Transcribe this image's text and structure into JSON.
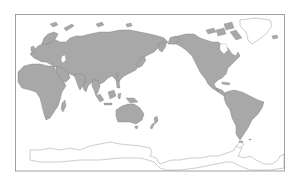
{
  "map": {
    "projection": "equirectangular",
    "center": "Pacific",
    "colors": {
      "land": "#a8a8a8",
      "land_outline": "#7a7a7a",
      "ocean": "#ffffff",
      "ice_outline": "#9a9a9a",
      "frame": "#8a8a8a"
    },
    "features": [
      {
        "name": "Eurasia"
      },
      {
        "name": "Africa"
      },
      {
        "name": "Australia"
      },
      {
        "name": "North America"
      },
      {
        "name": "South America"
      },
      {
        "name": "Greenland"
      },
      {
        "name": "Antarctica"
      },
      {
        "name": "New Zealand"
      },
      {
        "name": "Madagascar"
      },
      {
        "name": "Japan"
      },
      {
        "name": "Indonesia"
      }
    ]
  }
}
